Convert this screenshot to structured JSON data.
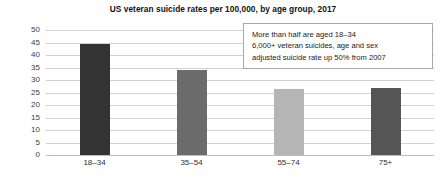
{
  "chart_data": {
    "type": "bar",
    "title": "US veteran suicide rates per 100,000, by age group, 2017",
    "xlabel": "",
    "ylabel": "",
    "categories": [
      "18–34",
      "35–54",
      "55–74",
      "75+"
    ],
    "values": [
      44.5,
      34,
      26.5,
      27
    ],
    "series": [
      {
        "name": "Suicide rate per 100,000",
        "values": [
          44.5,
          34,
          26.5,
          27
        ]
      }
    ],
    "bar_colors": [
      "#333333",
      "#6b6b6b",
      "#b5b5b5",
      "#555555"
    ],
    "ylim": [
      0,
      50
    ],
    "ytick_step": 5,
    "yticks": [
      50,
      45,
      40,
      35,
      30,
      25,
      20,
      15,
      10,
      5,
      0
    ],
    "ytick_labels": [
      "50",
      "45",
      "40",
      "35",
      "30",
      "25",
      "20",
      "15",
      "10",
      "5",
      "0"
    ],
    "grid": true,
    "grid_color": "#d2d2d2",
    "legend": false,
    "legend_position": "none",
    "annotations": [
      {
        "name": "callout",
        "lines": [
          "More than half are aged 18–34",
          "6,000+ veteran suicides, age and sex",
          "adjusted suicide rate up 50% from 2007"
        ],
        "border_color": "#a8a8a8",
        "background": "#ffffff"
      }
    ]
  }
}
